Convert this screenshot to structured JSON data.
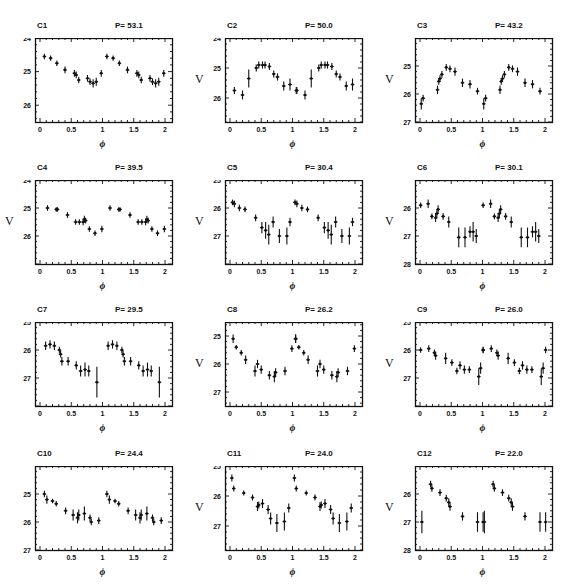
{
  "figure": {
    "x_label": "ϕ",
    "y_label": "V",
    "period_prefix": "P= "
  },
  "chart_data": {
    "type": "scatter",
    "xlabel": "ϕ (phase)",
    "ylabel": "V (mag)",
    "xlim": [
      0,
      2
    ],
    "x_ticks": [
      0,
      0.5,
      1,
      1.5,
      2
    ],
    "y_inverted": true,
    "grid": false,
    "panels": [
      {
        "name": "C1",
        "period": "53.1",
        "ylim": [
          24,
          26.5
        ],
        "y_ticks": [
          24,
          25,
          26
        ],
        "show_v": false,
        "points": [
          [
            0.07,
            24.55,
            0.08
          ],
          [
            0.17,
            24.6,
            0.08
          ],
          [
            0.27,
            24.75,
            0.08
          ],
          [
            0.4,
            24.95,
            0.1
          ],
          [
            0.55,
            25.05,
            0.1
          ],
          [
            0.58,
            25.1,
            0.1
          ],
          [
            0.62,
            25.25,
            0.1
          ],
          [
            0.76,
            25.2,
            0.1
          ],
          [
            0.8,
            25.3,
            0.1
          ],
          [
            0.85,
            25.35,
            0.12
          ],
          [
            0.9,
            25.3,
            0.12
          ],
          [
            0.98,
            25.05,
            0.1
          ]
        ]
      },
      {
        "name": "C2",
        "period": "50.0",
        "ylim": [
          24,
          26.8
        ],
        "y_ticks": [
          24,
          25,
          26
        ],
        "show_v": true,
        "points": [
          [
            0.07,
            25.75,
            0.12
          ],
          [
            0.2,
            25.9,
            0.15
          ],
          [
            0.3,
            25.35,
            0.3
          ],
          [
            0.42,
            25.0,
            0.12
          ],
          [
            0.46,
            24.9,
            0.12
          ],
          [
            0.52,
            24.9,
            0.12
          ],
          [
            0.56,
            24.9,
            0.12
          ],
          [
            0.63,
            24.95,
            0.12
          ],
          [
            0.7,
            25.2,
            0.12
          ],
          [
            0.76,
            25.3,
            0.12
          ],
          [
            0.86,
            25.6,
            0.15
          ],
          [
            0.96,
            25.55,
            0.2
          ],
          [
            1.06,
            25.75,
            0.12
          ]
        ]
      },
      {
        "name": "C3",
        "period": "43.2",
        "ylim": [
          24,
          27
        ],
        "y_ticks": [
          25,
          26,
          27
        ],
        "show_v": true,
        "points": [
          [
            0.02,
            26.35,
            0.2
          ],
          [
            0.05,
            26.15,
            0.12
          ],
          [
            0.28,
            25.85,
            0.15
          ],
          [
            0.3,
            25.55,
            0.12
          ],
          [
            0.32,
            25.45,
            0.12
          ],
          [
            0.35,
            25.3,
            0.12
          ],
          [
            0.42,
            25.05,
            0.12
          ],
          [
            0.48,
            25.1,
            0.12
          ],
          [
            0.56,
            25.2,
            0.15
          ],
          [
            0.68,
            25.6,
            0.15
          ],
          [
            0.8,
            25.65,
            0.15
          ],
          [
            0.92,
            25.9,
            0.12
          ]
        ]
      },
      {
        "name": "C4",
        "period": "39.5",
        "ylim": [
          24,
          27
        ],
        "y_ticks": [
          24,
          25,
          26
        ],
        "show_v": true,
        "points": [
          [
            0.12,
            25.0,
            0.1
          ],
          [
            0.26,
            25.05,
            0.08
          ],
          [
            0.28,
            25.05,
            0.08
          ],
          [
            0.44,
            25.25,
            0.1
          ],
          [
            0.57,
            25.5,
            0.1
          ],
          [
            0.63,
            25.5,
            0.1
          ],
          [
            0.69,
            25.5,
            0.12
          ],
          [
            0.71,
            25.4,
            0.12
          ],
          [
            0.73,
            25.45,
            0.1
          ],
          [
            0.79,
            25.75,
            0.1
          ],
          [
            0.88,
            25.9,
            0.1
          ],
          [
            0.99,
            25.75,
            0.12
          ]
        ]
      },
      {
        "name": "C5",
        "period": "30.4",
        "ylim": [
          25,
          28
        ],
        "y_ticks": [
          25,
          26,
          27
        ],
        "show_v": true,
        "points": [
          [
            0.04,
            25.8,
            0.1
          ],
          [
            0.07,
            25.85,
            0.12
          ],
          [
            0.15,
            26.0,
            0.12
          ],
          [
            0.24,
            26.05,
            0.1
          ],
          [
            0.41,
            26.35,
            0.12
          ],
          [
            0.51,
            26.7,
            0.2
          ],
          [
            0.57,
            26.8,
            0.3
          ],
          [
            0.62,
            26.95,
            0.35
          ],
          [
            0.69,
            26.5,
            0.2
          ],
          [
            0.79,
            27.0,
            0.25
          ],
          [
            0.91,
            27.0,
            0.3
          ],
          [
            0.96,
            26.5,
            0.15
          ]
        ]
      },
      {
        "name": "C6",
        "period": "30.1",
        "ylim": [
          25,
          28
        ],
        "y_ticks": [
          26,
          27,
          28
        ],
        "show_v": true,
        "points": [
          [
            0.01,
            25.9,
            0.1
          ],
          [
            0.13,
            25.85,
            0.15
          ],
          [
            0.19,
            26.3,
            0.1
          ],
          [
            0.25,
            26.35,
            0.15
          ],
          [
            0.27,
            26.2,
            0.15
          ],
          [
            0.29,
            26.05,
            0.15
          ],
          [
            0.37,
            26.3,
            0.12
          ],
          [
            0.46,
            26.5,
            0.2
          ],
          [
            0.62,
            27.05,
            0.35
          ],
          [
            0.72,
            27.05,
            0.35
          ],
          [
            0.8,
            26.85,
            0.2
          ],
          [
            0.85,
            26.85,
            0.35
          ],
          [
            0.9,
            27.0,
            0.25
          ]
        ]
      },
      {
        "name": "C7",
        "period": "29.5",
        "ylim": [
          25,
          28
        ],
        "y_ticks": [
          25,
          26,
          27
        ],
        "show_v": false,
        "points": [
          [
            0.09,
            25.85,
            0.15
          ],
          [
            0.16,
            25.8,
            0.15
          ],
          [
            0.23,
            25.85,
            0.15
          ],
          [
            0.31,
            26.0,
            0.12
          ],
          [
            0.33,
            26.15,
            0.12
          ],
          [
            0.35,
            26.4,
            0.15
          ],
          [
            0.45,
            26.4,
            0.15
          ],
          [
            0.58,
            26.55,
            0.15
          ],
          [
            0.65,
            26.75,
            0.2
          ],
          [
            0.72,
            26.7,
            0.25
          ],
          [
            0.78,
            26.75,
            0.2
          ],
          [
            0.91,
            27.15,
            0.55
          ]
        ]
      },
      {
        "name": "C8",
        "period": "26.2",
        "ylim": [
          24.5,
          27.5
        ],
        "y_ticks": [
          25,
          26,
          27
        ],
        "show_v": true,
        "points": [
          [
            0.05,
            25.1,
            0.15
          ],
          [
            0.1,
            25.4,
            0.08
          ],
          [
            0.18,
            25.6,
            0.1
          ],
          [
            0.25,
            25.85,
            0.15
          ],
          [
            0.4,
            26.25,
            0.2
          ],
          [
            0.44,
            26.0,
            0.15
          ],
          [
            0.5,
            26.2,
            0.15
          ],
          [
            0.63,
            26.4,
            0.15
          ],
          [
            0.71,
            26.45,
            0.2
          ],
          [
            0.73,
            26.3,
            0.15
          ],
          [
            0.88,
            26.25,
            0.15
          ],
          [
            0.99,
            25.45,
            0.12
          ],
          [
            1.05,
            25.1,
            0.15
          ]
        ]
      },
      {
        "name": "C9",
        "period": "26.0",
        "ylim": [
          25,
          28
        ],
        "y_ticks": [
          25,
          26,
          27
        ],
        "show_v": true,
        "points": [
          [
            0.01,
            26.0,
            0.1
          ],
          [
            0.14,
            25.95,
            0.12
          ],
          [
            0.23,
            26.1,
            0.12
          ],
          [
            0.25,
            26.2,
            0.15
          ],
          [
            0.41,
            26.3,
            0.2
          ],
          [
            0.51,
            26.45,
            0.12
          ],
          [
            0.59,
            26.75,
            0.12
          ],
          [
            0.64,
            26.55,
            0.15
          ],
          [
            0.71,
            26.7,
            0.15
          ],
          [
            0.79,
            26.7,
            0.12
          ],
          [
            0.94,
            26.95,
            0.3
          ],
          [
            0.97,
            26.65,
            0.2
          ],
          [
            1.01,
            26.0,
            0.12
          ]
        ]
      },
      {
        "name": "C10",
        "period": "24.4",
        "ylim": [
          24,
          27
        ],
        "y_ticks": [
          25,
          26,
          27
        ],
        "show_v": false,
        "points": [
          [
            0.07,
            25.0,
            0.12
          ],
          [
            0.11,
            25.2,
            0.15
          ],
          [
            0.2,
            25.25,
            0.08
          ],
          [
            0.26,
            25.35,
            0.1
          ],
          [
            0.41,
            25.6,
            0.12
          ],
          [
            0.53,
            25.75,
            0.2
          ],
          [
            0.6,
            25.85,
            0.2
          ],
          [
            0.62,
            25.75,
            0.2
          ],
          [
            0.71,
            25.7,
            0.25
          ],
          [
            0.8,
            25.85,
            0.12
          ],
          [
            0.82,
            26.0,
            0.12
          ],
          [
            0.94,
            25.95,
            0.12
          ]
        ]
      },
      {
        "name": "C11",
        "period": "24.0",
        "ylim": [
          25,
          27.8
        ],
        "y_ticks": [
          25,
          26,
          27
        ],
        "show_v": true,
        "points": [
          [
            0.03,
            25.4,
            0.12
          ],
          [
            0.06,
            25.75,
            0.1
          ],
          [
            0.22,
            25.9,
            0.08
          ],
          [
            0.36,
            26.05,
            0.1
          ],
          [
            0.44,
            26.35,
            0.15
          ],
          [
            0.46,
            26.3,
            0.12
          ],
          [
            0.52,
            26.25,
            0.15
          ],
          [
            0.61,
            26.45,
            0.15
          ],
          [
            0.65,
            26.75,
            0.2
          ],
          [
            0.75,
            26.9,
            0.3
          ],
          [
            0.87,
            26.85,
            0.3
          ],
          [
            0.94,
            26.4,
            0.15
          ]
        ]
      },
      {
        "name": "C12",
        "period": "22.0",
        "ylim": [
          25,
          28
        ],
        "y_ticks": [
          26,
          27,
          28
        ],
        "show_v": true,
        "points": [
          [
            0.03,
            27.0,
            0.4
          ],
          [
            0.17,
            25.65,
            0.12
          ],
          [
            0.19,
            25.8,
            0.12
          ],
          [
            0.32,
            25.95,
            0.12
          ],
          [
            0.42,
            26.15,
            0.12
          ],
          [
            0.46,
            26.3,
            0.15
          ],
          [
            0.48,
            26.45,
            0.15
          ],
          [
            0.68,
            26.8,
            0.15
          ],
          [
            0.92,
            27.0,
            0.35
          ],
          [
            1.01,
            27.0,
            0.35
          ]
        ]
      }
    ]
  }
}
